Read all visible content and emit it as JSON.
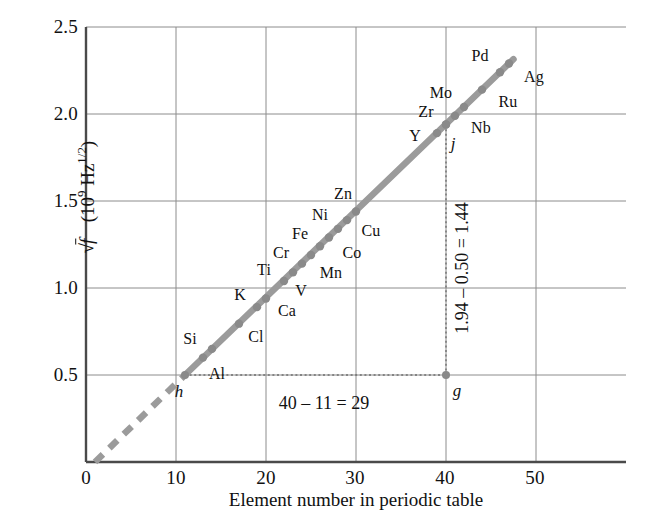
{
  "chart_data": {
    "type": "scatter",
    "title": "",
    "xlabel": "Element number in periodic table",
    "ylabel_parts": {
      "radical": "√",
      "variable": "f",
      "units": "(10",
      "unit_exp": "9",
      "unit_tail": " Hz",
      "unit_tail_exp": "1/2",
      "close": ")"
    },
    "ylabel": "√f  (10^9 Hz^1/2)",
    "xlim": [
      0,
      60
    ],
    "ylim": [
      0,
      2.5
    ],
    "xticks": [
      0,
      10,
      20,
      30,
      40,
      50
    ],
    "xtick_labels": [
      "0",
      "10",
      "20",
      "30",
      "40",
      "50"
    ],
    "yticks": [
      0.5,
      1.0,
      1.5,
      2.0,
      2.5
    ],
    "ytick_labels": [
      "0.5",
      "1.0",
      "1.5",
      "2.0",
      "2.5"
    ],
    "grid": true,
    "legend": "none",
    "line_color": "#9b9b9b",
    "grid_color": "#8c8c8c",
    "axis_color": "#4a4a4a",
    "points": [
      {
        "element": "Al",
        "x": 13,
        "y": 0.6,
        "label_dx": 14,
        "label_dy": 16
      },
      {
        "element": "Si",
        "x": 14,
        "y": 0.65,
        "label_dx": -22,
        "label_dy": -10
      },
      {
        "element": "Cl",
        "x": 17,
        "y": 0.795,
        "label_dx": 17,
        "label_dy": 13
      },
      {
        "element": "K",
        "x": 19,
        "y": 0.89,
        "label_dx": -17,
        "label_dy": -12
      },
      {
        "element": "Ca",
        "x": 20,
        "y": 0.94,
        "label_dx": 21,
        "label_dy": 13
      },
      {
        "element": "Ti",
        "x": 22,
        "y": 1.04,
        "label_dx": -20,
        "label_dy": -11
      },
      {
        "element": "V",
        "x": 23,
        "y": 1.09,
        "label_dx": 8,
        "label_dy": 19
      },
      {
        "element": "Cr",
        "x": 24,
        "y": 1.14,
        "label_dx": -21,
        "label_dy": -11
      },
      {
        "element": "Mn",
        "x": 25,
        "y": 1.19,
        "label_dx": 20,
        "label_dy": 18
      },
      {
        "element": "Fe",
        "x": 26,
        "y": 1.24,
        "label_dx": -20,
        "label_dy": -12
      },
      {
        "element": "Co",
        "x": 27,
        "y": 1.29,
        "label_dx": 23,
        "label_dy": 15
      },
      {
        "element": "Ni",
        "x": 28,
        "y": 1.34,
        "label_dx": -18,
        "label_dy": -14
      },
      {
        "element": "Cu",
        "x": 29,
        "y": 1.39,
        "label_dx": 24,
        "label_dy": 11
      },
      {
        "element": "Zn",
        "x": 30,
        "y": 1.44,
        "label_dx": -13,
        "label_dy": -17
      },
      {
        "element": "Y",
        "x": 39,
        "y": 1.89,
        "label_dx": -22,
        "label_dy": 3
      },
      {
        "element": "Zr",
        "x": 40,
        "y": 1.94,
        "label_dx": -20,
        "label_dy": -12
      },
      {
        "element": "Nb",
        "x": 41,
        "y": 1.99,
        "label_dx": 26,
        "label_dy": 12
      },
      {
        "element": "Mo",
        "x": 42,
        "y": 2.04,
        "label_dx": -23,
        "label_dy": -14
      },
      {
        "element": "Ru",
        "x": 44,
        "y": 2.14,
        "label_dx": 26,
        "label_dy": 12
      },
      {
        "element": "Pd",
        "x": 46,
        "y": 2.24,
        "label_dx": -20,
        "label_dy": -16
      },
      {
        "element": "Ag",
        "x": 47,
        "y": 2.29,
        "label_dx": 25,
        "label_dy": 13
      }
    ],
    "markers": [
      {
        "name": "h",
        "x": 11,
        "y": 0.5,
        "label": "h",
        "label_dx": -6,
        "label_dy": 17
      },
      {
        "name": "g",
        "x": 40,
        "y": 0.5,
        "label": "g",
        "label_dx": 11,
        "label_dy": 16
      },
      {
        "name": "j",
        "x": 40,
        "y": 1.94,
        "label": "j",
        "label_dx": 7,
        "label_dy": 20
      }
    ],
    "fit_line": {
      "x_start": 11,
      "y_start": 0.5,
      "x_end": 47.5,
      "y_end": 2.315
    },
    "extrapolation": {
      "x_start": 1,
      "y_start": 0.0,
      "x_end": 11,
      "y_end": 0.5,
      "style": "dashed"
    },
    "construction_lines": [
      {
        "from": [
          11,
          0.5
        ],
        "to": [
          40,
          0.5
        ],
        "style": "dotted"
      },
      {
        "from": [
          40,
          0.5
        ],
        "to": [
          40,
          1.94
        ],
        "style": "dotted"
      }
    ],
    "annotations": [
      {
        "id": "run",
        "text": "40 – 11 = 29",
        "orientation": "horizontal"
      },
      {
        "id": "rise",
        "text": "1.94 – 0.50 = 1.44",
        "orientation": "vertical"
      }
    ]
  }
}
